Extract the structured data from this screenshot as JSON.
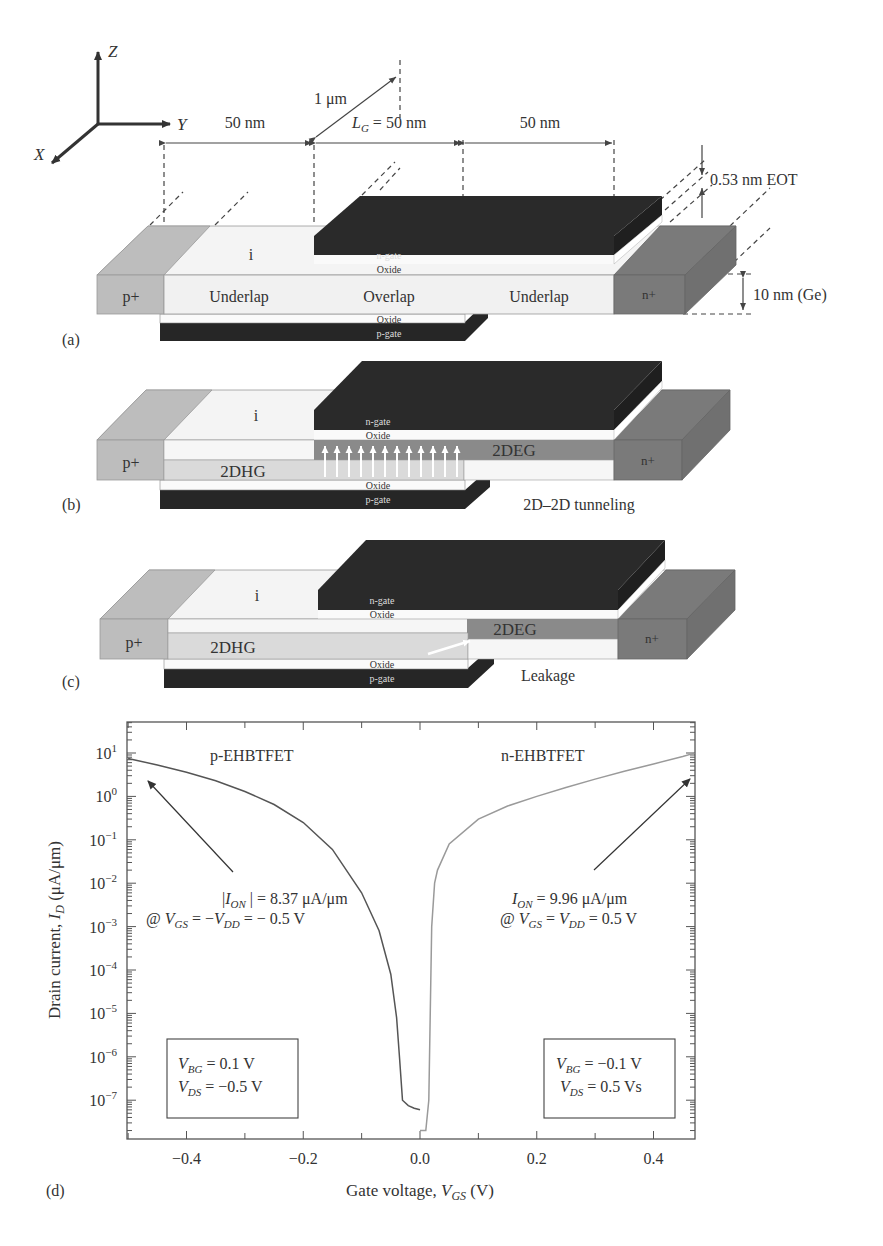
{
  "axes_glyph": {
    "z": "Z",
    "y": "Y",
    "x": "X"
  },
  "dimensions": {
    "width_label": "1 μm",
    "left_underlap": "50 nm",
    "gate_length_prefix": "L",
    "gate_length_sub": "G",
    "gate_length_value": " = 50 nm",
    "right_underlap": "50 nm",
    "eot": "0.53 nm EOT",
    "thickness": "10 nm (Ge)"
  },
  "panel_a": {
    "tag": "(a)",
    "source": "p+",
    "drain": "n+",
    "intrinsic": "i",
    "region_left": "Underlap",
    "region_mid": "Overlap",
    "region_right": "Underlap",
    "top_gate": "n-gate",
    "top_oxide": "Oxide",
    "bottom_oxide": "Oxide",
    "bottom_gate": "p-gate"
  },
  "panel_b": {
    "tag": "(b)",
    "source": "p+",
    "drain": "n+",
    "intrinsic": "i",
    "hole_gas": "2DHG",
    "electron_gas": "2DEG",
    "top_gate": "n-gate",
    "top_oxide": "Oxide",
    "bottom_oxide": "Oxide",
    "bottom_gate": "p-gate",
    "caption": "2D–2D tunneling"
  },
  "panel_c": {
    "tag": "(c)",
    "source": "p+",
    "drain": "n+",
    "intrinsic": "i",
    "hole_gas": "2DHG",
    "electron_gas": "2DEG",
    "top_gate": "n-gate",
    "top_oxide": "Oxide",
    "bottom_oxide": "Oxide",
    "bottom_gate": "p-gate",
    "caption": "Leakage"
  },
  "panel_d": {
    "tag": "(d)",
    "p_label": "p-EHBTFET",
    "n_label": "n-EHBTFET",
    "p_annot_line1": "|I_ON| = 8.37 μA/μm",
    "p_annot_line2": "@ V_GS = −V_DD = − 0.5 V",
    "n_annot_line1": "I_ON = 9.96 μA/μm",
    "n_annot_line2": "@ V_GS = V_DD = 0.5 V",
    "p_box_line1": "V_BG = 0.1 V",
    "p_box_line2": "V_DS = −0.5 V",
    "n_box_line1": "V_BG = −0.1 V",
    "n_box_line2": "V_DS = 0.5 Vs"
  },
  "chart_data": {
    "type": "line",
    "title": "",
    "xlabel": "Gate voltage, V_GS (V)",
    "ylabel": "Drain current, I_D (μA/μm)",
    "xlim": [
      -0.5,
      0.47
    ],
    "ylim": [
      3e-08,
      50
    ],
    "yscale": "log",
    "x_ticks": [
      "−0.4",
      "−0.2",
      "0.0",
      "0.2",
      "0.4"
    ],
    "y_ticks": [
      "10^1",
      "10^0",
      "10^-1",
      "10^-2",
      "10^-3",
      "10^-4",
      "10^-5",
      "10^-6",
      "10^-7"
    ],
    "grid": false,
    "series": [
      {
        "name": "p-EHBTFET",
        "color": "#555555",
        "x": [
          -0.5,
          -0.45,
          -0.4,
          -0.35,
          -0.3,
          -0.25,
          -0.2,
          -0.15,
          -0.1,
          -0.07,
          -0.05,
          -0.04,
          -0.035,
          -0.03,
          -0.02,
          -0.01,
          0.0
        ],
        "y": [
          7.5,
          5.3,
          3.6,
          2.3,
          1.3,
          0.65,
          0.25,
          0.06,
          0.006,
          0.0008,
          8e-05,
          8e-06,
          9e-07,
          1e-07,
          7.5e-08,
          6.5e-08,
          6e-08
        ]
      },
      {
        "name": "n-EHBTFET",
        "color": "#999999",
        "x": [
          0.0,
          0.01,
          0.015,
          0.02,
          0.025,
          0.03,
          0.05,
          0.1,
          0.15,
          0.2,
          0.25,
          0.3,
          0.35,
          0.4,
          0.45,
          0.47
        ],
        "y": [
          2e-08,
          2e-08,
          1e-07,
          0.001,
          0.01,
          0.02,
          0.08,
          0.3,
          0.6,
          1.0,
          1.6,
          2.5,
          3.8,
          5.6,
          8.3,
          9.96
        ]
      }
    ],
    "annotations": [
      "|I_ON| = 8.37 μA/μm @ V_GS = −V_DD = −0.5 V",
      "I_ON = 9.96 μA/μm @ V_GS = V_DD = 0.5 V",
      "V_BG = 0.1 V, V_DS = −0.5 V",
      "V_BG = −0.1 V, V_DS = 0.5 Vs"
    ]
  }
}
